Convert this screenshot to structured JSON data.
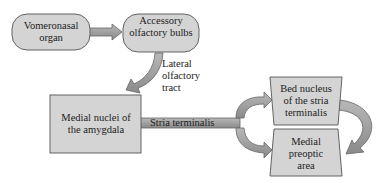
{
  "nodes": {
    "vomeronasal": {
      "label": "Vomeronasal organ"
    },
    "accessory": {
      "label": "Accessory olfactory bulbs"
    },
    "medial_nuclei": {
      "label": "Medial nuclei of the amygdala"
    },
    "bed_nucleus": {
      "label": "Bed nucleus of the stria terminalis"
    },
    "preoptic": {
      "label": "Medial preoptic area"
    }
  },
  "edges": {
    "lateral_tract": {
      "label": "Lateral olfactory tract"
    },
    "stria": {
      "label": "Stria terminalis"
    }
  },
  "colors": {
    "fill": "#d4d4d4",
    "arrow": "#9a9a9a",
    "stroke": "#555555"
  }
}
